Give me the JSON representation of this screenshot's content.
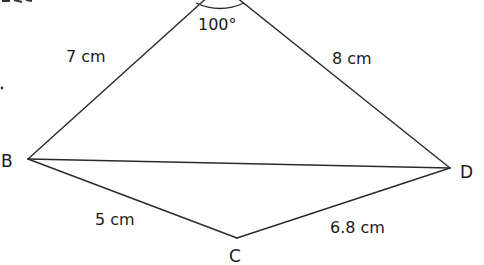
{
  "diagram": {
    "type": "quadrilateral-with-diagonal",
    "vertices": [
      {
        "id": "A",
        "label": "",
        "x": 221,
        "y": -15,
        "note": "apex cut off above frame"
      },
      {
        "id": "B",
        "label": "B",
        "x": 28,
        "y": 159
      },
      {
        "id": "C",
        "label": "C",
        "x": 237,
        "y": 238
      },
      {
        "id": "D",
        "label": "D",
        "x": 450,
        "y": 168
      }
    ],
    "edges": [
      {
        "from": "A",
        "to": "B",
        "label": "7 cm"
      },
      {
        "from": "A",
        "to": "D",
        "label": "8 cm"
      },
      {
        "from": "B",
        "to": "C",
        "label": "5 cm"
      },
      {
        "from": "C",
        "to": "D",
        "label": "6.8 cm"
      },
      {
        "from": "B",
        "to": "D",
        "label": ""
      }
    ],
    "angles": [
      {
        "at": "A",
        "label": "100°"
      }
    ],
    "labels": {
      "B": "B",
      "C": "C",
      "D": "D",
      "AB": "7 cm",
      "AD": "8 cm",
      "BC": "5 cm",
      "CD": "6.8 cm",
      "angle_A": "100°"
    }
  }
}
